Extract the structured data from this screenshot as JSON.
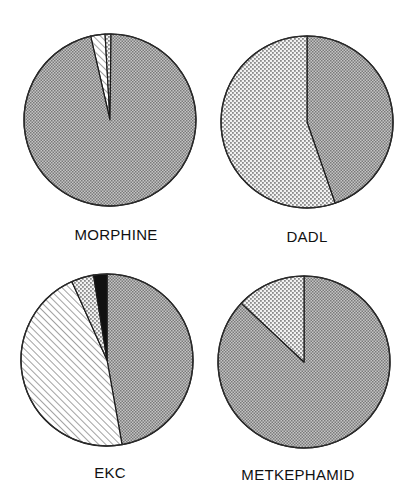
{
  "chart_data": [
    {
      "type": "pie",
      "title": "MORPHINE",
      "start_angle_deg": -13,
      "direction": "clockwise",
      "slices": [
        {
          "category": "diagonal-hatch",
          "pattern": "hatch",
          "value": 2.7
        },
        {
          "category": "light-dots",
          "pattern": "lightdots",
          "value": 1.1
        },
        {
          "category": "dense-grey",
          "pattern": "dense",
          "value": 96.2
        }
      ],
      "center": [
        110,
        120
      ],
      "radius": 86,
      "label_pos": [
        116,
        240
      ]
    },
    {
      "type": "pie",
      "title": "DADL",
      "start_angle_deg": 0,
      "direction": "clockwise",
      "slices": [
        {
          "category": "dense-grey",
          "pattern": "dense",
          "value": 44.7
        },
        {
          "category": "light-dots",
          "pattern": "lightdots",
          "value": 55.3
        }
      ],
      "center": [
        307,
        122
      ],
      "radius": 86,
      "label_pos": [
        307,
        242
      ]
    },
    {
      "type": "pie",
      "title": "EKC",
      "start_angle_deg": 0,
      "direction": "clockwise",
      "slices": [
        {
          "category": "dense-grey",
          "pattern": "dense",
          "value": 47.2
        },
        {
          "category": "diagonal-hatch",
          "pattern": "hatch",
          "value": 46.1
        },
        {
          "category": "light-dots",
          "pattern": "lightdots",
          "value": 4.2
        },
        {
          "category": "black",
          "pattern": "black",
          "value": 2.5
        }
      ],
      "center": [
        107,
        360
      ],
      "radius": 86,
      "label_pos": [
        110,
        478
      ]
    },
    {
      "type": "pie",
      "title": "METKEPHAMID",
      "start_angle_deg": 0,
      "direction": "clockwise",
      "slices": [
        {
          "category": "dense-grey",
          "pattern": "dense",
          "value": 87
        },
        {
          "category": "light-dots",
          "pattern": "lightdots",
          "value": 13
        }
      ],
      "center": [
        304,
        362
      ],
      "radius": 86,
      "label_pos": [
        298,
        480
      ]
    }
  ],
  "labels": {
    "morphine": "MORPHINE",
    "dadl": "DADL",
    "ekc": "EKC",
    "metkephamid": "METKEPHAMID"
  },
  "colors": {
    "dense_dark": "#7a7a7a",
    "dense_light": "#c4c4c4",
    "lightdots_dot": "#8c8c8c",
    "lightdots_bg": "#f2f2f2",
    "hatch_line": "#8a8a8a",
    "black": "#111111",
    "outline": "#1a1a1a"
  }
}
